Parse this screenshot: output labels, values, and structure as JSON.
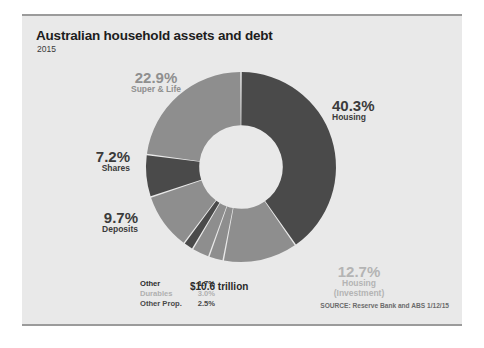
{
  "header": {
    "title": "Australian household assets and debt",
    "subtitle": "2015"
  },
  "center_total": "$10.6 trillion",
  "source": "SOURCE: Reserve Bank and ABS 1/12/15",
  "colors": {
    "dark": "#4a4a4a",
    "mid": "#8e8e8e",
    "light": "#b9b9b9",
    "card_bg": "#e9e9e9",
    "rule": "#9b9b9b",
    "text_dark": "#3b3b3b",
    "text_mid": "#8f8f8f",
    "text_light": "#b4b4b4"
  },
  "labels": [
    {
      "pct": "40.3%",
      "name": "Housing",
      "tone": "dark"
    },
    {
      "pct": "22.9%",
      "name": "Super & Life",
      "tone": "mid"
    },
    {
      "pct": "7.2%",
      "name": "Shares",
      "tone": "dark"
    },
    {
      "pct": "9.7%",
      "name": "Deposits",
      "tone": "dark"
    },
    {
      "pct": "12.7%",
      "name": "Housing",
      "name2": "(Investment)",
      "tone": "light"
    }
  ],
  "legend": {
    "rows": [
      {
        "label": "Other",
        "value": "1.7%",
        "tone": "dark"
      },
      {
        "label": "Durables",
        "value": "3.0%",
        "tone": "light"
      },
      {
        "label": "Other Prop.",
        "value": "2.5%",
        "tone": "mid"
      }
    ]
  },
  "chart_data": {
    "type": "pie",
    "title": "Australian household assets and debt",
    "subtitle": "2015",
    "center_label": "$10.6 trillion",
    "donut": true,
    "inner_radius_ratio": 0.44,
    "start_angle_deg": 0,
    "direction": "clockwise",
    "categories": [
      "Housing",
      "Housing (Investment)",
      "Other Prop.",
      "Durables",
      "Other",
      "Deposits",
      "Shares",
      "Super & Life"
    ],
    "values": [
      40.3,
      12.7,
      2.5,
      3.0,
      1.7,
      9.7,
      7.2,
      22.9
    ],
    "unit": "percent",
    "slice_colors": [
      "#4a4a4a",
      "#8e8e8e",
      "#8e8e8e",
      "#8e8e8e",
      "#4a4a4a",
      "#8e8e8e",
      "#4a4a4a",
      "#8e8e8e"
    ],
    "total": "$10.6 trillion",
    "source": "SOURCE: Reserve Bank and ABS 1/12/15",
    "legend_position": "none",
    "grid": false
  }
}
